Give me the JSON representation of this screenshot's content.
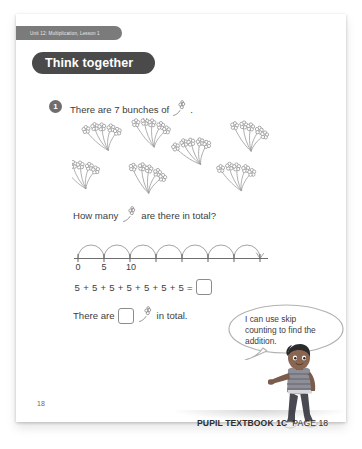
{
  "banner": {
    "unit_label": "Unit 12: Multiplication, Lesson 1"
  },
  "heading": {
    "title": "Think together"
  },
  "question": {
    "number": "1",
    "prompt_before": "There are 7 bunches of",
    "prompt_after": ".",
    "bunch_count": 7,
    "flowers_per_bunch": 5
  },
  "howmany": {
    "before": "How many",
    "after": "are there in total?"
  },
  "numberline": {
    "tick_labels": [
      "0",
      "5",
      "10",
      "",
      "",
      "",
      "",
      ""
    ],
    "jump_count": 7,
    "step": 5
  },
  "equation": {
    "terms": [
      "5",
      "+",
      "5",
      "+",
      "5",
      "+",
      "5",
      "+",
      "5",
      "+",
      "5",
      "+",
      "5",
      "="
    ],
    "answer": ""
  },
  "total_sentence": {
    "before": "There are",
    "after": "in total.",
    "answer": ""
  },
  "speech": {
    "text": "I can use skip counting to find the addition."
  },
  "page_number": "18",
  "footer": {
    "book": "PUPIL TEXTBOOK 1C",
    "page": "PAGE 18"
  },
  "colors": {
    "banner_bg": "#7b7b7b",
    "heading_bg": "#4a4a4a",
    "badge_bg": "#6e6e6e",
    "text": "#3d3d3d",
    "line": "#8c8c8c"
  }
}
